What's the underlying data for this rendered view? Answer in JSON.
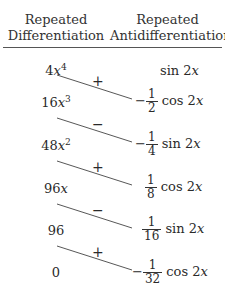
{
  "header": {
    "left": [
      "Repeated",
      "Differentiation"
    ],
    "right": [
      "Repeated",
      "Antidifferentiation"
    ]
  },
  "rows": [
    {
      "left": {
        "coef": "4",
        "var": "x",
        "exp": "4"
      },
      "right": {
        "sign": "",
        "num": "",
        "den": "",
        "fn": "sin 2",
        "var": "x"
      }
    },
    {
      "left": {
        "coef": "16",
        "var": "x",
        "exp": "3"
      },
      "right": {
        "sign": "−",
        "num": "1",
        "den": "2",
        "fn": "cos 2",
        "var": "x"
      }
    },
    {
      "left": {
        "coef": "48",
        "var": "x",
        "exp": "2"
      },
      "right": {
        "sign": "−",
        "num": "1",
        "den": "4",
        "fn": "sin 2",
        "var": "x"
      }
    },
    {
      "left": {
        "coef": "96",
        "var": "x",
        "exp": ""
      },
      "right": {
        "sign": "",
        "num": "1",
        "den": "8",
        "fn": "cos 2",
        "var": "x"
      }
    },
    {
      "left": {
        "coef": "96",
        "var": "",
        "exp": ""
      },
      "right": {
        "sign": "",
        "num": "1",
        "den": "16",
        "fn": "sin 2",
        "var": "x"
      }
    },
    {
      "left": {
        "coef": "0",
        "var": "",
        "exp": ""
      },
      "right": {
        "sign": "−",
        "num": "1",
        "den": "32",
        "fn": "cos 2",
        "var": "x"
      }
    }
  ],
  "signs": [
    "+",
    "−",
    "+",
    "−",
    "+"
  ],
  "colors": {
    "text": "#2a2a2a",
    "rule": "#555555",
    "line": "#444444"
  }
}
